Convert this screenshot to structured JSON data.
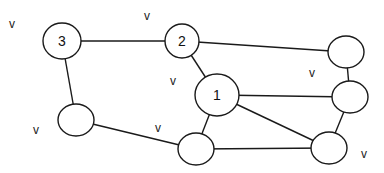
{
  "graph": {
    "nodes": [
      {
        "id": "n3",
        "label": "3"
      },
      {
        "id": "n2",
        "label": "2"
      },
      {
        "id": "nTR",
        "label": ""
      },
      {
        "id": "n1",
        "label": "1"
      },
      {
        "id": "nRM",
        "label": ""
      },
      {
        "id": "nLB",
        "label": ""
      },
      {
        "id": "nBC",
        "label": ""
      },
      {
        "id": "nBR",
        "label": ""
      }
    ],
    "edges": [
      [
        "n3",
        "n2"
      ],
      [
        "n2",
        "nTR"
      ],
      [
        "n2",
        "n1"
      ],
      [
        "nTR",
        "nRM"
      ],
      [
        "n1",
        "nRM"
      ],
      [
        "n1",
        "nBR"
      ],
      [
        "n1",
        "nBC"
      ],
      [
        "nRM",
        "nBR"
      ],
      [
        "nBC",
        "nBR"
      ],
      [
        "n3",
        "nLB"
      ],
      [
        "nLB",
        "nBC"
      ]
    ],
    "marks": [
      "v",
      "v",
      "v",
      "v",
      "v",
      "v",
      "v"
    ]
  }
}
